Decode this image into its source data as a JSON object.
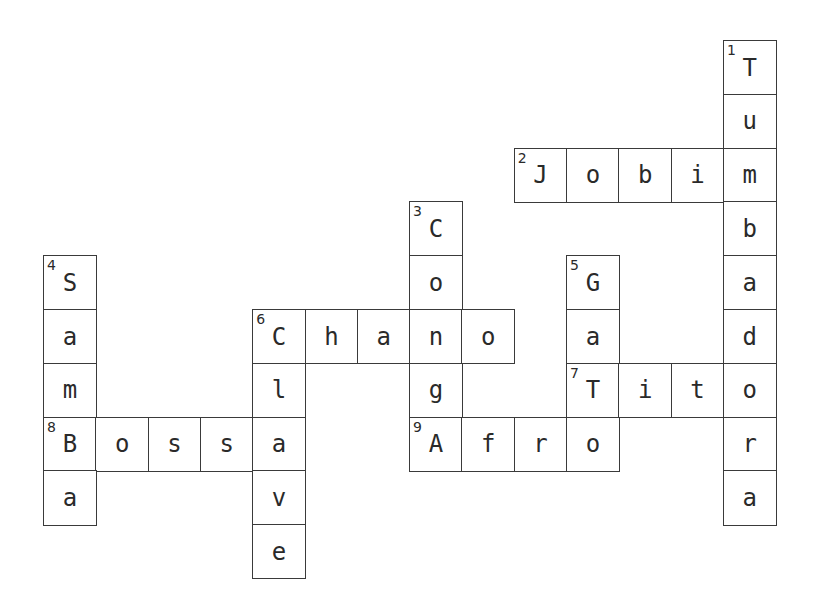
{
  "puzzle": {
    "grid": {
      "origin_x": 43,
      "origin_y": 40,
      "cell_w": 52.3,
      "cell_h": 53.8
    },
    "entries": [
      {
        "number": 1,
        "direction": "down",
        "answer": "Tumbadora",
        "col": 13,
        "row": 0
      },
      {
        "number": 2,
        "direction": "across",
        "answer": "Jobim",
        "col": 9,
        "row": 2
      },
      {
        "number": 3,
        "direction": "down",
        "answer": "CongA",
        "display": "Cong",
        "col": 7,
        "row": 3
      },
      {
        "number": 4,
        "direction": "down",
        "answer": "Samba",
        "col": 0,
        "row": 4
      },
      {
        "number": 5,
        "direction": "down",
        "answer": "Gato",
        "col": 10,
        "row": 4
      },
      {
        "number": 6,
        "direction": "across",
        "answer": "Chano",
        "col": 4,
        "row": 5
      },
      {
        "number": 6,
        "direction": "down",
        "answer": "Clave",
        "col": 4,
        "row": 5
      },
      {
        "number": 7,
        "direction": "across",
        "answer": "Tito",
        "col": 10,
        "row": 6
      },
      {
        "number": 8,
        "direction": "across",
        "answer": "Bossa",
        "col": 0,
        "row": 7
      },
      {
        "number": 9,
        "direction": "across",
        "answer": "Afro",
        "col": 7,
        "row": 7
      }
    ],
    "cells": [
      {
        "c": 13,
        "r": 0,
        "ch": "T",
        "n": "1"
      },
      {
        "c": 13,
        "r": 1,
        "ch": "u"
      },
      {
        "c": 9,
        "r": 2,
        "ch": "J",
        "n": "2"
      },
      {
        "c": 10,
        "r": 2,
        "ch": "o"
      },
      {
        "c": 11,
        "r": 2,
        "ch": "b"
      },
      {
        "c": 12,
        "r": 2,
        "ch": "i"
      },
      {
        "c": 13,
        "r": 2,
        "ch": "m"
      },
      {
        "c": 7,
        "r": 3,
        "ch": "C",
        "n": "3"
      },
      {
        "c": 13,
        "r": 3,
        "ch": "b"
      },
      {
        "c": 0,
        "r": 4,
        "ch": "S",
        "n": "4"
      },
      {
        "c": 7,
        "r": 4,
        "ch": "o"
      },
      {
        "c": 10,
        "r": 4,
        "ch": "G",
        "n": "5"
      },
      {
        "c": 13,
        "r": 4,
        "ch": "a"
      },
      {
        "c": 0,
        "r": 5,
        "ch": "a"
      },
      {
        "c": 4,
        "r": 5,
        "ch": "C",
        "n": "6"
      },
      {
        "c": 5,
        "r": 5,
        "ch": "h"
      },
      {
        "c": 6,
        "r": 5,
        "ch": "a"
      },
      {
        "c": 7,
        "r": 5,
        "ch": "n"
      },
      {
        "c": 8,
        "r": 5,
        "ch": "o"
      },
      {
        "c": 10,
        "r": 5,
        "ch": "a"
      },
      {
        "c": 13,
        "r": 5,
        "ch": "d"
      },
      {
        "c": 0,
        "r": 6,
        "ch": "m"
      },
      {
        "c": 4,
        "r": 6,
        "ch": "l"
      },
      {
        "c": 7,
        "r": 6,
        "ch": "g"
      },
      {
        "c": 10,
        "r": 6,
        "ch": "T",
        "n": "7"
      },
      {
        "c": 11,
        "r": 6,
        "ch": "i"
      },
      {
        "c": 12,
        "r": 6,
        "ch": "t"
      },
      {
        "c": 13,
        "r": 6,
        "ch": "o"
      },
      {
        "c": 0,
        "r": 7,
        "ch": "B",
        "n": "8"
      },
      {
        "c": 1,
        "r": 7,
        "ch": "o"
      },
      {
        "c": 2,
        "r": 7,
        "ch": "s"
      },
      {
        "c": 3,
        "r": 7,
        "ch": "s"
      },
      {
        "c": 4,
        "r": 7,
        "ch": "a"
      },
      {
        "c": 7,
        "r": 7,
        "ch": "A",
        "n": "9"
      },
      {
        "c": 8,
        "r": 7,
        "ch": "f"
      },
      {
        "c": 9,
        "r": 7,
        "ch": "r"
      },
      {
        "c": 10,
        "r": 7,
        "ch": "o"
      },
      {
        "c": 13,
        "r": 7,
        "ch": "r"
      },
      {
        "c": 0,
        "r": 8,
        "ch": "a"
      },
      {
        "c": 4,
        "r": 8,
        "ch": "v"
      },
      {
        "c": 13,
        "r": 8,
        "ch": "a"
      },
      {
        "c": 4,
        "r": 9,
        "ch": "e"
      }
    ]
  }
}
